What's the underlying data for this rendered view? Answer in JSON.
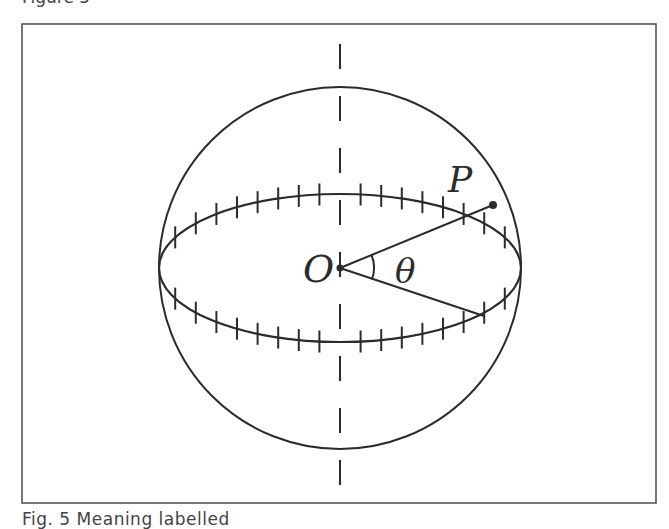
{
  "captions": {
    "top": "Figure 5",
    "bottom": "Fig. 5  Meaning labelled"
  },
  "figure": {
    "frame": {
      "x": 22,
      "y": 24,
      "width": 634,
      "height": 479,
      "stroke": "#555555"
    },
    "sphere": {
      "cx": 340,
      "cy": 268,
      "r": 181,
      "stroke": "#2b2b2b"
    },
    "equator": {
      "cx": 340,
      "cy": 268,
      "rx": 181,
      "ry": 74,
      "tick_count_per_side": 16,
      "tick_spacing": 20.6
    },
    "axis": {
      "x": 340,
      "y1": 30,
      "y2": 492,
      "dash": "25 27",
      "style": "dashed"
    },
    "origin": {
      "x": 340,
      "y": 268
    },
    "point_p": {
      "x": 493,
      "y": 205
    },
    "line_end_lower": {
      "x": 483,
      "y": 316
    },
    "labels": {
      "origin": "O",
      "point": "P",
      "angle": "θ"
    }
  }
}
